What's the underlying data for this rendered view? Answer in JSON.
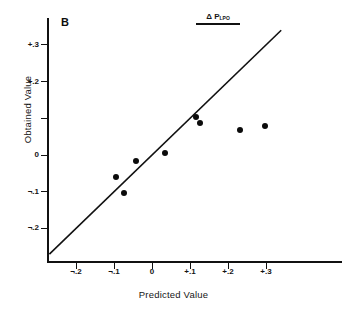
{
  "figure": {
    "panel_label": "B",
    "legend": {
      "symbol": "Δ",
      "variable": "P",
      "subscript": "LPO",
      "underline": true
    }
  },
  "axes": {
    "x": {
      "title": "Predicted Value",
      "ticks": [
        {
          "label": "¬.2",
          "value": -0.2
        },
        {
          "label": "¬.1",
          "value": -0.1
        },
        {
          "label": "0",
          "value": 0
        },
        {
          "label": "+.1",
          "value": 0.1
        },
        {
          "label": "+.2",
          "value": 0.2
        },
        {
          "label": "+.3",
          "value": 0.3
        }
      ],
      "range": [
        -0.27,
        0.5
      ]
    },
    "y": {
      "title": "Obtained Value",
      "ticks": [
        {
          "label": "+.3",
          "value": 0.3
        },
        {
          "label": "+.2",
          "value": 0.2
        },
        {
          "label": "",
          "value": 0.1
        },
        {
          "label": "0",
          "value": 0
        },
        {
          "label": "¬.1",
          "value": -0.1
        },
        {
          "label": "¬.2",
          "value": -0.2
        }
      ],
      "range": [
        -0.3,
        0.34
      ]
    }
  },
  "chart_data": {
    "type": "scatter",
    "title": "B",
    "xlabel": "Predicted Value",
    "ylabel": "Obtained Value",
    "xlim": [
      -0.27,
      0.5
    ],
    "ylim": [
      -0.3,
      0.34
    ],
    "grid": false,
    "legend": "Δ P LPO",
    "legend_position": "top-center",
    "series": [
      {
        "name": "Δ P LPO",
        "marker": "filled-circle",
        "color": "#0b0b0b",
        "points": [
          {
            "x": -0.095,
            "y": -0.06
          },
          {
            "x": -0.074,
            "y": -0.103
          },
          {
            "x": -0.043,
            "y": -0.015
          },
          {
            "x": 0.035,
            "y": 0.005
          },
          {
            "x": 0.116,
            "y": 0.103
          },
          {
            "x": 0.127,
            "y": 0.087
          },
          {
            "x": 0.232,
            "y": 0.068
          },
          {
            "x": 0.298,
            "y": 0.079
          }
        ]
      }
    ],
    "reference_line": {
      "name": "identity-line",
      "type": "y=x",
      "from": {
        "x": -0.27,
        "y": -0.27
      },
      "to": {
        "x": 0.34,
        "y": 0.34
      },
      "color": "#111111"
    }
  }
}
